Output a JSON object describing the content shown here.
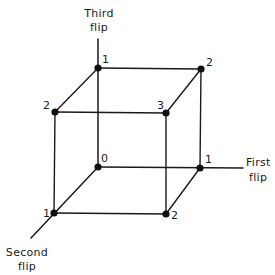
{
  "diagram": {
    "type": "cube-state-space",
    "axes": {
      "first": {
        "line1": "First",
        "line2": "flip"
      },
      "second": {
        "line1": "Second",
        "line2": "flip"
      },
      "third": {
        "line1": "Third",
        "line2": "flip"
      }
    },
    "vertices": {
      "origin": {
        "label": "0"
      },
      "first_axis": {
        "label": "1"
      },
      "second_axis": {
        "label": "1"
      },
      "third_axis": {
        "label": "1"
      },
      "first_second": {
        "label": "2"
      },
      "first_third": {
        "label": "2"
      },
      "second_third": {
        "label": "2"
      },
      "all_three": {
        "label": "3"
      }
    },
    "colors": {
      "ink": "#1a1a1a",
      "background": "#ffffff"
    }
  }
}
